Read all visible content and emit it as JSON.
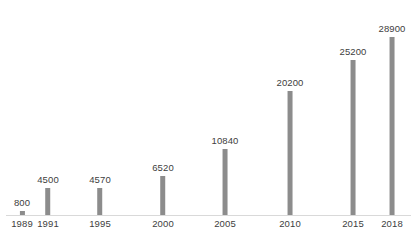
{
  "chart_data": {
    "type": "bar",
    "title": "",
    "subtitle": "",
    "xlabel": "",
    "ylabel": "",
    "categories": [
      "1989",
      "1991",
      "1995",
      "2000",
      "2005",
      "2010",
      "2015",
      "2018"
    ],
    "values": [
      800,
      4500,
      4570,
      6520,
      10840,
      20200,
      25200,
      28900
    ],
    "value_labels": [
      "800",
      "4500",
      "4570",
      "6520",
      "10840",
      "20200",
      "25200",
      "28900"
    ],
    "ylim": [
      0,
      28900
    ],
    "grid": false,
    "legend": false,
    "axis_visible": {
      "x": true,
      "y": false
    },
    "bar_color": "#8c8c8c",
    "label_color": "#404040",
    "axis_line_color": "#d9d9d9",
    "background_color": "#ffffff",
    "bar_positions_px": [
      22,
      48,
      100,
      163,
      225,
      290,
      353,
      392
    ]
  }
}
